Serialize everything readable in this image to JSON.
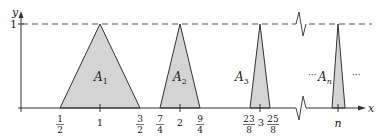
{
  "figure": {
    "axes": {
      "x_label": "x",
      "y_label": "y",
      "y_tick_label": "1"
    },
    "x_ticks": [
      {
        "num": "1",
        "den": "2",
        "x": 60
      },
      {
        "text": "1",
        "x": 100
      },
      {
        "num": "3",
        "den": "2",
        "x": 140
      },
      {
        "num": "7",
        "den": "4",
        "x": 160
      },
      {
        "text": "2",
        "x": 180
      },
      {
        "num": "9",
        "den": "4",
        "x": 200
      },
      {
        "num": "23",
        "den": "8",
        "x": 250
      },
      {
        "text": "3",
        "x": 260
      },
      {
        "num": "25",
        "den": "8",
        "x": 270
      },
      {
        "text": "n",
        "x": 338
      }
    ],
    "regions": [
      {
        "label": "A",
        "sub": "1"
      },
      {
        "label": "A",
        "sub": "2"
      },
      {
        "label": "A",
        "sub": "3"
      },
      {
        "label": "A",
        "sub": "n"
      }
    ],
    "ellipsis": "···",
    "colors": {
      "fill": "#d4d4d4",
      "stroke": "#333333"
    }
  }
}
